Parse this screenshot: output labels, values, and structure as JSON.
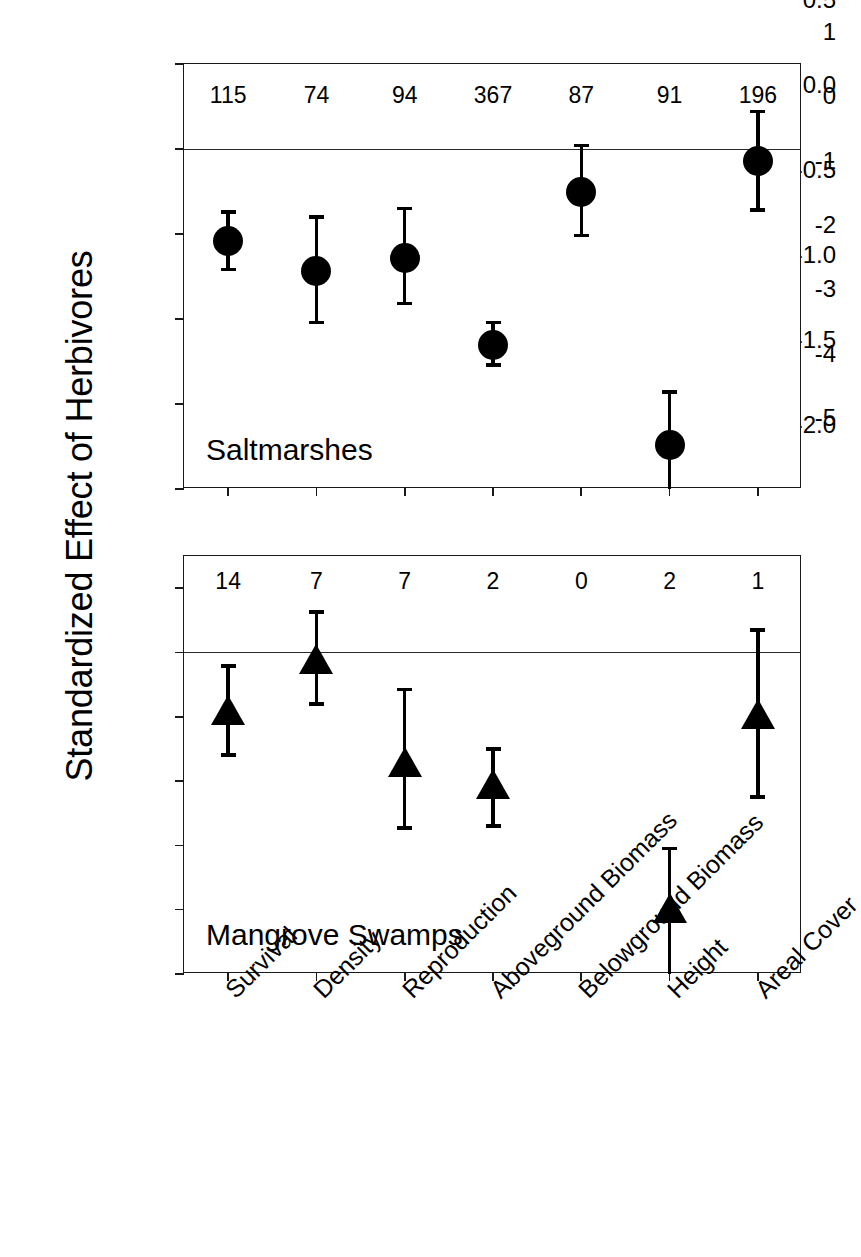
{
  "figure": {
    "y_axis_title": "Standardized Effect of Herbivores"
  },
  "panels": [
    {
      "id": "saltmarshes",
      "caption": "Saltmarshes",
      "ylim": [
        -2.0,
        0.5
      ],
      "yticks": [
        "0.5",
        "0.0",
        "-0.5",
        "-1.0",
        "-1.5",
        "-2.0"
      ],
      "ytick_values": [
        0.5,
        0.0,
        -0.5,
        -1.0,
        -1.5,
        -2.0
      ],
      "marker": "circle"
    },
    {
      "id": "mangrove-swamps",
      "caption": "Mangrove Swamps",
      "ylim": [
        -5,
        1.5
      ],
      "yticks": [
        "1",
        "0",
        "-1",
        "-2",
        "-3",
        "-4",
        "-5"
      ],
      "ytick_values": [
        1,
        0,
        -1,
        -2,
        -3,
        -4,
        -5
      ],
      "marker": "triangle"
    }
  ],
  "categories": [
    "Survival",
    "Density",
    "Reproduction",
    "Aboveground Biomass",
    "Belowground Biomass",
    "Height",
    "Areal Cover"
  ],
  "chart_data": {
    "type": "scatter",
    "title": "",
    "xlabel": "",
    "ylabel": "Standardized Effect of Herbivores",
    "grid": false,
    "legend": "none",
    "error_bars": "95% confidence intervals",
    "categories": [
      "Survival",
      "Density",
      "Reproduction",
      "Aboveground Biomass",
      "Belowground Biomass",
      "Height",
      "Areal Cover"
    ],
    "panels": [
      {
        "name": "Saltmarshes",
        "marker": "circle",
        "ylim": [
          -2.0,
          0.5
        ],
        "yticks": [
          0.5,
          0.0,
          -0.5,
          -1.0,
          -1.5,
          -2.0
        ],
        "zero_line": 0.0,
        "sample_sizes": [
          115,
          74,
          94,
          367,
          87,
          91,
          196
        ],
        "values": [
          -0.54,
          -0.72,
          -0.64,
          -1.15,
          -0.25,
          -1.74,
          -0.07
        ],
        "ci_lower": [
          -0.72,
          -1.03,
          -0.92,
          -1.28,
          -0.52,
          -2.02,
          -0.37
        ],
        "ci_upper": [
          -0.36,
          -0.39,
          -0.34,
          -1.01,
          0.03,
          -1.42,
          0.23
        ]
      },
      {
        "name": "Mangrove Swamps",
        "marker": "triangle",
        "ylim": [
          -5,
          1.5
        ],
        "yticks": [
          1,
          0,
          -1,
          -2,
          -3,
          -4,
          -5
        ],
        "zero_line": 0.0,
        "sample_sizes": [
          14,
          7,
          7,
          2,
          0,
          2,
          1
        ],
        "values": [
          -0.9,
          -0.1,
          -1.7,
          -2.05,
          null,
          -3.98,
          -0.95
        ],
        "ci_lower": [
          -1.62,
          -0.83,
          -2.76,
          -2.73,
          null,
          -5.0,
          -2.28
        ],
        "ci_upper": [
          -0.18,
          0.66,
          -0.55,
          -1.47,
          null,
          -3.02,
          0.38
        ]
      }
    ]
  }
}
